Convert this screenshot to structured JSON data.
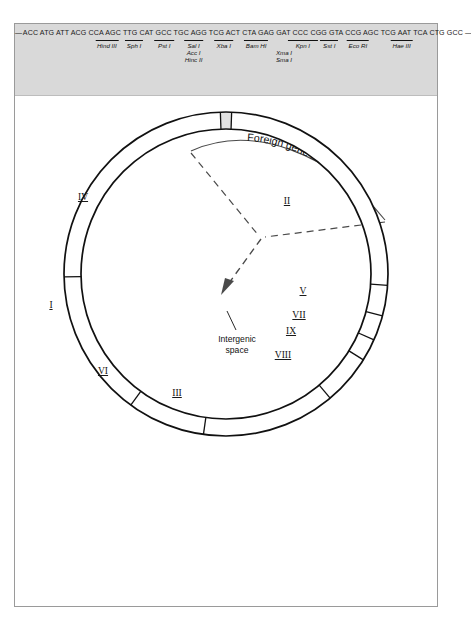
{
  "polylinker": {
    "lead_dash": "—",
    "sequence": "ACC ATG ATT ACG CCA AGC TTG CAT GCC TGC AGG TCG ACT CTA GAG GAT CCC CGG GTA CCG AGC TCG AAT TCA CTG GCC",
    "trail_dash": "—",
    "enzymes": [
      {
        "name": "Hind III",
        "x": 122,
        "bar": 30
      },
      {
        "name": "Sph I",
        "x": 158,
        "bar": 24
      },
      {
        "name": "Pst I",
        "x": 198,
        "bar": 26
      },
      {
        "name": "Sal I",
        "x": 237,
        "bar": 26
      },
      {
        "name": "Xba I",
        "x": 277,
        "bar": 26
      },
      {
        "name": "Bam HI",
        "x": 320,
        "bar": 32
      },
      {
        "name": "Kpn I",
        "x": 382,
        "bar": 40
      },
      {
        "name": "Sst I",
        "x": 417,
        "bar": 24
      },
      {
        "name": "Eco RI",
        "x": 455,
        "bar": 30
      },
      {
        "name": "Hae III",
        "x": 513,
        "bar": 30
      }
    ],
    "enzymes_stacked": [
      {
        "names": [
          "Acc I",
          "Hinc II"
        ],
        "x": 237,
        "y": 9
      },
      {
        "names": [
          "Xma I",
          "Sma I"
        ],
        "x": 357,
        "y": 9
      }
    ]
  },
  "callout": {
    "label": "Foreign gene insert"
  },
  "plasmid": {
    "intergenic_label_line1": "Intergenic",
    "intergenic_label_line2": "space",
    "segments": [
      {
        "label": "I",
        "start": 181,
        "end": 234,
        "lx": 36,
        "ly": 212
      },
      {
        "label": "VI",
        "start": 234,
        "end": 262,
        "lx": 88,
        "ly": 278
      },
      {
        "label": "III",
        "start": 262,
        "end": 310,
        "lx": 162,
        "ly": 300
      },
      {
        "label": "VIII",
        "start": 310,
        "end": 328,
        "lx": 268,
        "ly": 262
      },
      {
        "label": "IX",
        "start": 328,
        "end": 336,
        "lx": 276,
        "ly": 238
      },
      {
        "label": "VII",
        "start": 336,
        "end": 345,
        "lx": 284,
        "ly": 222
      },
      {
        "label": "V",
        "start": 345,
        "end": 356,
        "lx": 288,
        "ly": 198
      },
      {
        "label": "II",
        "start": 356,
        "end": 448,
        "lx": 272,
        "ly": 108
      },
      {
        "label": "IV",
        "start": 452,
        "end": 541,
        "lx": 68,
        "ly": 104
      }
    ],
    "gap_start": 448,
    "gap_end": 452
  }
}
